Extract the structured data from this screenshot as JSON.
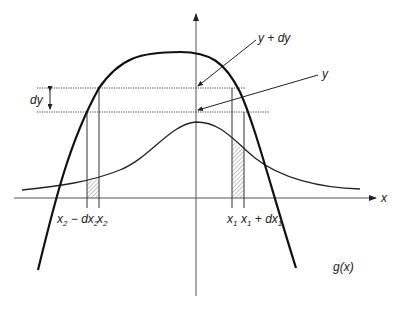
{
  "diagram": {
    "type": "transformation-of-random-variable",
    "curves": [
      {
        "name": "g(x)",
        "label": "g(x)",
        "description": "monotone-changing transform curve, peaks near y-axis"
      },
      {
        "name": "pdf",
        "label": "",
        "description": "bell-shaped density curve centered at y-axis"
      }
    ],
    "axes": {
      "x_label": "x",
      "y_label": ""
    },
    "levels": {
      "upper": "y + dy",
      "lower": "y",
      "interval": "dy"
    },
    "x_ticks": {
      "left": [
        "x₂ − dx₂",
        "x₂"
      ],
      "right": [
        "x₁",
        "x₁ + dx₁"
      ]
    },
    "labels": {
      "dy": "dy",
      "y_plus_dy": "y + dy",
      "y": "y",
      "x_axis": "x",
      "gx": "g(x)",
      "x2_minus_dx2_main": "x",
      "x2_minus_dx2_sub1": "2",
      "x2_minus_dx2_mid": " − dx",
      "x2_minus_dx2_sub2": "2",
      "x2_main": "x",
      "x2_sub": "2",
      "x1_main": "x",
      "x1_sub": "1",
      "x1_plus_main": "x",
      "x1_plus_sub1": "1",
      "x1_plus_mid": " + dx",
      "x1_plus_sub2": "1"
    },
    "colors": {
      "stroke": "#222222",
      "hatch": "#888888",
      "dotted": "#444444"
    }
  }
}
